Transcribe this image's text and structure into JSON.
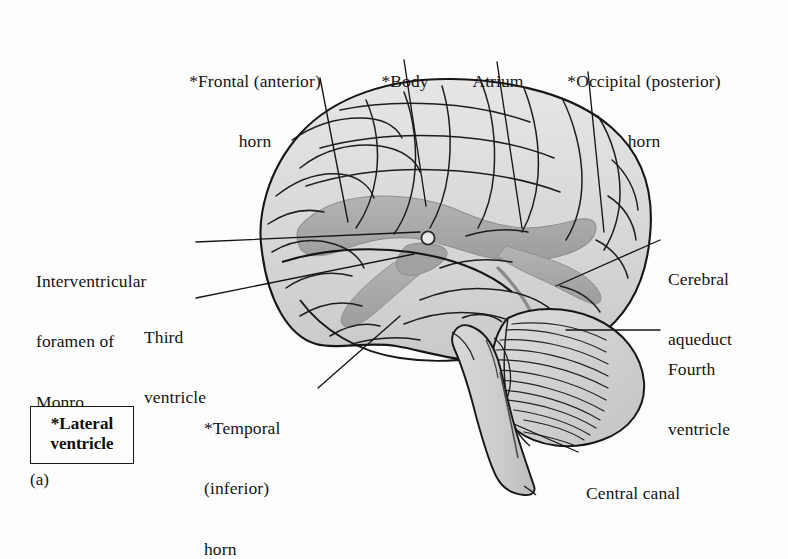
{
  "figure": {
    "caption": "(a)",
    "legend": {
      "line1": "*Lateral",
      "line2": "ventricle"
    },
    "background_color": "#fdfdfd",
    "ink_color": "#1a1a1a",
    "brain_fill": "#d8d8d8",
    "ventricle_fill": "#a8a8a8"
  },
  "labels": [
    {
      "name": "frontal-horn",
      "lines": [
        "*Frontal (anterior)",
        "horn"
      ],
      "align": "center"
    },
    {
      "name": "body",
      "lines": [
        "*Body"
      ],
      "align": "center"
    },
    {
      "name": "atrium",
      "lines": [
        "Atrium"
      ],
      "align": "center"
    },
    {
      "name": "occipital-horn",
      "lines": [
        "*Occipital (posterior)",
        "horn"
      ],
      "align": "center"
    },
    {
      "name": "interventricular-foramen",
      "lines": [
        "Interventricular",
        "foramen of",
        "Monro"
      ],
      "align": "left"
    },
    {
      "name": "third-ventricle",
      "lines": [
        "Third",
        "ventricle"
      ],
      "align": "left"
    },
    {
      "name": "temporal-horn",
      "lines": [
        "*Temporal",
        "(inferior)",
        "horn"
      ],
      "align": "left"
    },
    {
      "name": "cerebral-aqueduct",
      "lines": [
        "Cerebral",
        "aqueduct"
      ],
      "align": "left"
    },
    {
      "name": "fourth-ventricle",
      "lines": [
        "Fourth",
        "ventricle"
      ],
      "align": "left"
    },
    {
      "name": "central-canal",
      "lines": [
        "Central canal"
      ],
      "align": "left"
    }
  ]
}
